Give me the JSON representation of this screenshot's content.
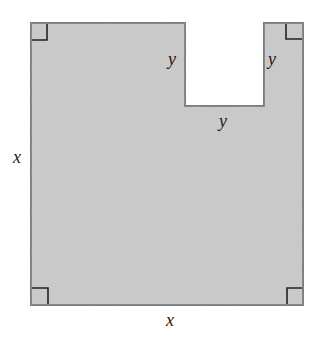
{
  "figure": {
    "colors": {
      "fill": "#c4c4c4",
      "stroke": "#7a7a7a",
      "right_angle_mark": "#222222",
      "background": "#ffffff"
    },
    "labels": {
      "left_side": "x",
      "bottom_side": "x",
      "notch_left_side": "y",
      "notch_right_side": "y",
      "notch_bottom": "y"
    },
    "right_angle_markers": [
      "top-left",
      "top-right",
      "bottom-left",
      "bottom-right"
    ]
  }
}
